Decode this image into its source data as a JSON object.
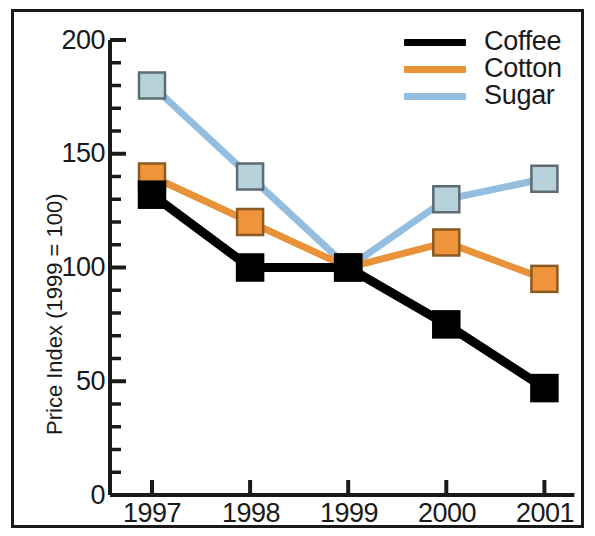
{
  "chart_data": {
    "type": "line",
    "title": "",
    "subtitle": "",
    "xlabel": "",
    "ylabel": "Price Index (1999 = 100)",
    "categories": [
      "1997",
      "1998",
      "1999",
      "2000",
      "2001"
    ],
    "x": [
      1997,
      1998,
      1999,
      2000,
      2001
    ],
    "series": [
      {
        "name": "Coffee",
        "color": "#000000",
        "marker": "square",
        "values": [
          132,
          100,
          100,
          75,
          47
        ]
      },
      {
        "name": "Cotton",
        "color": "#E8933A",
        "marker": "square",
        "values": [
          140,
          120,
          100,
          111,
          95
        ]
      },
      {
        "name": "Sugar",
        "color": "#93BEE0",
        "marker": "square",
        "values": [
          180,
          140,
          100,
          130,
          139
        ]
      }
    ],
    "ylim": [
      0,
      200
    ],
    "yticks": [
      0,
      50,
      100,
      150,
      200
    ],
    "ytick_labels": [
      "0",
      "50",
      "100",
      "150",
      "200"
    ],
    "yminor_step": 10,
    "xtick_labels": [
      "1997",
      "1998",
      "1999",
      "2000",
      "2001"
    ],
    "grid": false,
    "legend_position": "top-right",
    "legend_entries": [
      "Coffee",
      "Cotton",
      "Sugar"
    ],
    "annotations": []
  },
  "legend": {
    "items": [
      {
        "label": "Coffee",
        "color": "#000000"
      },
      {
        "label": "Cotton",
        "color": "#E8933A"
      },
      {
        "label": "Sugar",
        "color": "#93BEE0"
      }
    ]
  },
  "axes": {
    "y_title": "Price Index (1999 = 100)",
    "y_labels": [
      "200",
      "150",
      "100",
      "50",
      "0"
    ],
    "x_labels": [
      "1997",
      "1998",
      "1999",
      "2000",
      "2001"
    ]
  },
  "colors": {
    "coffee": "#000000",
    "cotton": "#E8933A",
    "cotton_marker_fill": "#F0943C",
    "sugar": "#93BEE0",
    "sugar_marker_fill": "#B8D2DC",
    "axis": "#1a1a1a",
    "background": "#ffffff"
  }
}
